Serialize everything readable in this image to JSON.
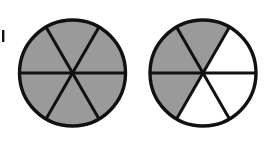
{
  "figure": {
    "title": "",
    "width": 264,
    "height": 145,
    "background_color": "#ffffff",
    "stroke_color": "#111111",
    "shaded_color": "#9a9a9a",
    "unshaded_color": "#ffffff",
    "outline_width": 3.4,
    "spoke_width": 3.0,
    "margin_mark": {
      "name": "margin-tick-mark",
      "x": 2,
      "y": 30,
      "width": 2.4,
      "height": 12,
      "color": "#111111"
    },
    "diagrams": [
      {
        "id": "left-fraction-circle",
        "label": "",
        "center_x": 72.5,
        "center_y": 73,
        "radius": 53,
        "sector_count": 6,
        "sector_angle_deg": 60,
        "start_angle_deg": 0,
        "shaded_count": 6,
        "unshaded_count": 0,
        "fraction": "6/6",
        "sectors": [
          {
            "index": 0,
            "from_deg": 0,
            "to_deg": 60,
            "shaded": true
          },
          {
            "index": 1,
            "from_deg": 60,
            "to_deg": 120,
            "shaded": true
          },
          {
            "index": 2,
            "from_deg": 120,
            "to_deg": 180,
            "shaded": true
          },
          {
            "index": 3,
            "from_deg": 180,
            "to_deg": 240,
            "shaded": true
          },
          {
            "index": 4,
            "from_deg": 240,
            "to_deg": 300,
            "shaded": true
          },
          {
            "index": 5,
            "from_deg": 300,
            "to_deg": 360,
            "shaded": true
          }
        ]
      },
      {
        "id": "right-fraction-circle",
        "label": "",
        "center_x": 203,
        "center_y": 73,
        "radius": 53,
        "sector_count": 6,
        "sector_angle_deg": 60,
        "start_angle_deg": 0,
        "shaded_count": 3,
        "unshaded_count": 3,
        "fraction": "3/6",
        "sectors": [
          {
            "index": 0,
            "from_deg": 0,
            "to_deg": 60,
            "shaded": false
          },
          {
            "index": 1,
            "from_deg": 60,
            "to_deg": 120,
            "shaded": true
          },
          {
            "index": 2,
            "from_deg": 120,
            "to_deg": 180,
            "shaded": true
          },
          {
            "index": 3,
            "from_deg": 180,
            "to_deg": 240,
            "shaded": true
          },
          {
            "index": 4,
            "from_deg": 240,
            "to_deg": 300,
            "shaded": false
          },
          {
            "index": 5,
            "from_deg": 300,
            "to_deg": 360,
            "shaded": false
          }
        ]
      }
    ]
  }
}
